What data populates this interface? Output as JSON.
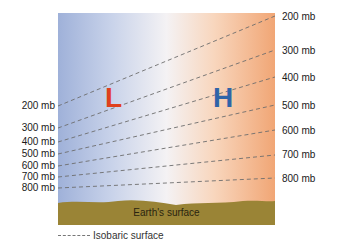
{
  "diagram": {
    "title": "",
    "high_low": {
      "low_label": "L",
      "high_label": "H",
      "low_color": "#e0401c",
      "high_color": "#2f64a8"
    },
    "left_labels": [
      "200 mb",
      "300 mb",
      "400 mb",
      "500 mb",
      "600 mb",
      "700 mb",
      "800 mb"
    ],
    "right_labels": [
      "200 mb",
      "300 mb",
      "400 mb",
      "500 mb",
      "600 mb",
      "700 mb",
      "800 mb"
    ],
    "ground_label": "Earth's surface",
    "legend": {
      "label": "Isobaric surface"
    },
    "colors": {
      "cold_side": "#9fb1d9",
      "warm_side": "#f1a675",
      "ground": "#9a8436",
      "isobar": "#6d6d6d"
    }
  }
}
